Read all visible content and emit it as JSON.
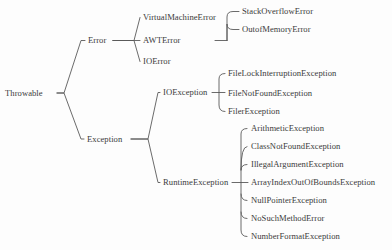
{
  "diagram": {
    "type": "tree",
    "orientation": "left-to-right",
    "style": {
      "background": "#fdfdfd",
      "text_color": "#3b3b3b",
      "line_color": "#5a5a5a"
    },
    "nodes": [
      {
        "id": "throwable",
        "label": "Throwable",
        "x": 5,
        "y": 93,
        "anchor": "start"
      },
      {
        "id": "error",
        "label": "Error",
        "x": 88,
        "y": 40,
        "anchor": "start"
      },
      {
        "id": "virtualmachineerror",
        "label": "VirtualMachineError",
        "x": 143,
        "y": 17,
        "anchor": "start"
      },
      {
        "id": "awterror",
        "label": "AWTError",
        "x": 143,
        "y": 40,
        "anchor": "start"
      },
      {
        "id": "ioerror",
        "label": "IOError",
        "x": 143,
        "y": 61,
        "anchor": "start"
      },
      {
        "id": "stackoverflowerror",
        "label": "StackOverflowError",
        "x": 242,
        "y": 11,
        "anchor": "start"
      },
      {
        "id": "outofmemoryerror",
        "label": "OutofMemoryError",
        "x": 242,
        "y": 29,
        "anchor": "start"
      },
      {
        "id": "exception",
        "label": "Exception",
        "x": 87,
        "y": 139,
        "anchor": "start"
      },
      {
        "id": "ioexception",
        "label": "IOException",
        "x": 163,
        "y": 92,
        "anchor": "start"
      },
      {
        "id": "filelockinterruptionexception",
        "label": "FileLockInterruptionException",
        "x": 228,
        "y": 73,
        "anchor": "start"
      },
      {
        "id": "filenotfoundexception",
        "label": "FileNotFoundException",
        "x": 228,
        "y": 93,
        "anchor": "start"
      },
      {
        "id": "filerexception",
        "label": "FilerException",
        "x": 228,
        "y": 111,
        "anchor": "start"
      },
      {
        "id": "runtimeexception",
        "label": "RuntimeException",
        "x": 163,
        "y": 182,
        "anchor": "start"
      },
      {
        "id": "arithmeticexception",
        "label": "ArithmeticException",
        "x": 251,
        "y": 128,
        "anchor": "start"
      },
      {
        "id": "classnotfoundexception",
        "label": "ClassNotFoundException",
        "x": 251,
        "y": 146,
        "anchor": "start"
      },
      {
        "id": "illegalargumentexception",
        "label": "IllegalArgumentException",
        "x": 251,
        "y": 164,
        "anchor": "start"
      },
      {
        "id": "arrayindexoutofboundsexception",
        "label": "ArrayIndexOutOfBoundsException",
        "x": 251,
        "y": 182,
        "anchor": "start"
      },
      {
        "id": "nullpointerexception",
        "label": "NullPointerException",
        "x": 251,
        "y": 200,
        "anchor": "start"
      },
      {
        "id": "nosuchmethoderror",
        "label": "NoSuchMethodError",
        "x": 251,
        "y": 218,
        "anchor": "start"
      },
      {
        "id": "numberformatexception",
        "label": "NumberFormatException",
        "x": 251,
        "y": 236,
        "anchor": "start"
      }
    ],
    "edges": [
      {
        "from": "throwable",
        "to": "error",
        "d": "M 57 93 L 64 93 L 81 40.5 L 85 40.5"
      },
      {
        "from": "throwable",
        "to": "exception",
        "d": "M 57 93 L 64 93 L 81 139 L 84 139"
      },
      {
        "from": "error",
        "to": "virtualmachineerror",
        "d": "M 113 40.5 L 134 40.5 L 140 17.5"
      },
      {
        "from": "error",
        "to": "awterror",
        "d": "M 113 40.5 L 140 40.5"
      },
      {
        "from": "error",
        "to": "ioerror",
        "d": "M 113 40.5 L 134 40.5 L 140 61.5"
      },
      {
        "from": "virtualmachineerror",
        "to": "stackoverflowerror",
        "d": "M 215 40.5 L 227 40.5 M 227 40.5 L 227 17 Q 227 11.5 233 11.5 L 239 11.5"
      },
      {
        "from": "virtualmachineerror",
        "to": "outofmemoryerror",
        "d": "M 227 40.5 L 227 24 Q 227 29.5 233 29.5 L 239 29.5"
      },
      {
        "from": "exception",
        "to": "ioexception",
        "d": "M 131 139 L 148 139 L 158 92.5 L 160 92.5"
      },
      {
        "from": "exception",
        "to": "runtimeexception",
        "d": "M 131 139 L 148 139 L 158 182.5 L 160 182.5"
      },
      {
        "from": "ioexception",
        "to": "filenotfoundexception",
        "d": "M 212 92.5 L 225 92.5"
      },
      {
        "from": "ioexception",
        "to": "filelockinterruptionexception",
        "d": "M 219 92.5 L 219 79 Q 219 73.5 225 73.5"
      },
      {
        "from": "ioexception",
        "to": "filerexception",
        "d": "M 219 92.5 L 219 105 Q 219 111.5 225 111.5"
      },
      {
        "from": "runtimeexception",
        "to": "arrayindexoutofboundsexception",
        "d": "M 232 182.5 L 248 182.5"
      },
      {
        "from": "runtimeexception",
        "to": "arithmeticexception",
        "d": "M 241 182.5 L 241 134 Q 241 128.5 247 128.5"
      },
      {
        "from": "runtimeexception",
        "to": "classnotfoundexception",
        "d": "M 241 170 Q 241 146.5 247 146.5"
      },
      {
        "from": "runtimeexception",
        "to": "illegalargumentexception",
        "d": "M 241 170 Q 241 164.5 247 164.5"
      },
      {
        "from": "runtimeexception",
        "to": "nullpointerexception",
        "d": "M 241 194 Q 241 200.5 247 200.5"
      },
      {
        "from": "runtimeexception",
        "to": "nosuchmethoderror",
        "d": "M 241 212 Q 241 218.5 247 218.5"
      },
      {
        "from": "runtimeexception",
        "to": "numberformatexception",
        "d": "M 241 182.5 L 241 230 Q 241 236.5 247 236.5"
      }
    ]
  }
}
